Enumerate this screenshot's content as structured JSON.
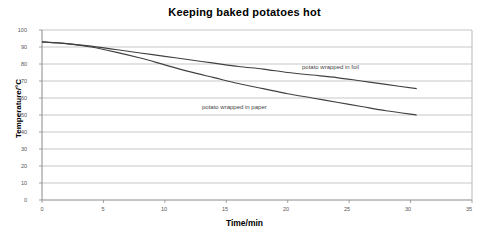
{
  "chart_data": {
    "type": "line",
    "title": "Keeping baked potatoes hot",
    "xlabel": "Time/min",
    "ylabel": "Temperature/°C",
    "xlim": [
      0,
      35
    ],
    "ylim": [
      0,
      100
    ],
    "xticks": [
      0,
      5,
      10,
      15,
      20,
      25,
      30,
      35
    ],
    "yticks": [
      0,
      10,
      20,
      30,
      40,
      50,
      60,
      70,
      80,
      90,
      100
    ],
    "grid": "horizontal",
    "legend_position": "inline-annotation",
    "series": [
      {
        "name": "potato wrapped in foil",
        "color": "#404040",
        "x": [
          0,
          2,
          4,
          6,
          8,
          10,
          12,
          14,
          16,
          18,
          20,
          22,
          24,
          26,
          28,
          30.5
        ],
        "values": [
          93,
          92,
          90.5,
          88.5,
          86.5,
          84.5,
          82.5,
          80.5,
          78.5,
          77,
          75,
          73.5,
          72,
          70,
          68,
          65.5
        ]
      },
      {
        "name": "potato wrapped in paper",
        "color": "#404040",
        "x": [
          0,
          2,
          4,
          6,
          8,
          10,
          12,
          14,
          16,
          18,
          20,
          22,
          24,
          26,
          28,
          30.5
        ],
        "values": [
          93,
          92,
          90,
          87,
          83.5,
          79.5,
          75.5,
          72,
          68.5,
          65.5,
          62.5,
          60,
          57.5,
          55,
          52.5,
          50
        ]
      }
    ],
    "annotations": [
      {
        "text": "potato wrapped in foil",
        "x": 21.5,
        "y": 79
      },
      {
        "text": "potato wrapped in paper",
        "x": 13.5,
        "y": 60
      }
    ]
  },
  "axis": {
    "ytick_labels": [
      "100",
      "90",
      "80",
      "70",
      "60",
      "50",
      "40",
      "30",
      "20",
      "10",
      "0"
    ],
    "xtick_labels": [
      "0",
      "5",
      "10",
      "15",
      "20",
      "25",
      "30",
      "35"
    ]
  },
  "colors": {
    "grid": "#b9b9b9",
    "axis": "#8a8a8a",
    "line": "#404040",
    "text": "#000000",
    "tick_text": "#555555",
    "background": "#ffffff"
  }
}
